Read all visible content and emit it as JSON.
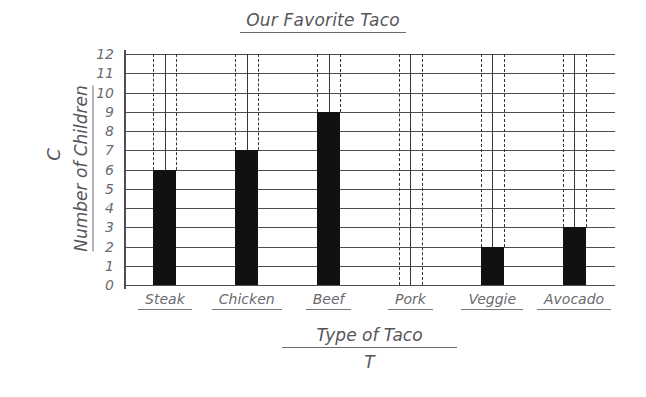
{
  "chart_data": {
    "type": "bar",
    "title": "Our Favorite Taco",
    "xlabel": "Type of Taco",
    "ylabel": "Number of Children",
    "x_variable": "T",
    "y_variable": "C",
    "categories": [
      "Steak",
      "Chicken",
      "Beef",
      "Pork",
      "Veggie",
      "Avocado"
    ],
    "values": [
      6,
      7,
      9,
      0,
      2,
      3
    ],
    "ylim": [
      0,
      12
    ],
    "y_tick_step": 1,
    "y_ticks": [
      "12",
      "11",
      "10",
      "9",
      "8",
      "7",
      "6",
      "5",
      "4",
      "3",
      "2",
      "1",
      "0"
    ],
    "grid": true,
    "legend": "none",
    "bar_color": "#111114",
    "text_color": "#56565a",
    "gridline_color": "#4d4d52",
    "background_color": "#ffffff",
    "annotations": "Each category has a solid vertical center line and two dashed vertical edge lines extending from the bar top to the top gridline."
  }
}
